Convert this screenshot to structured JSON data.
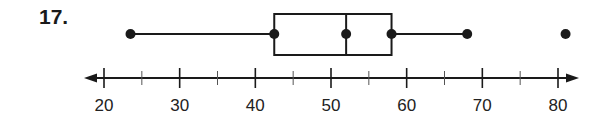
{
  "problem": {
    "number": "17."
  },
  "chart_data": {
    "type": "boxplot",
    "title": "",
    "xlabel": "",
    "ylabel": "",
    "xlim": [
      18,
      83
    ],
    "axis": {
      "major_ticks": [
        20,
        30,
        40,
        50,
        60,
        70,
        80
      ],
      "minor_ticks": [
        25,
        35,
        45,
        55,
        65,
        75
      ],
      "tick_labels": [
        "20",
        "30",
        "40",
        "50",
        "60",
        "70",
        "80"
      ],
      "arrows": "both",
      "grid": false
    },
    "summary": {
      "min": 23.5,
      "q1": 42.5,
      "median": 52,
      "q3": 58,
      "max_whisker": 68,
      "outliers": [
        81
      ]
    },
    "colors": {
      "stroke": "#1a1a1a",
      "fill": "#ffffff"
    }
  }
}
